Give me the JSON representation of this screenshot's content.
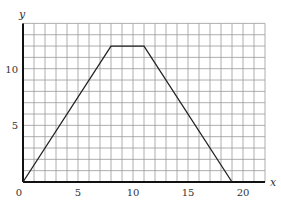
{
  "chart_data": {
    "type": "line",
    "title": "",
    "xlabel": "x",
    "ylabel": "y",
    "xlim": [
      0,
      22
    ],
    "ylim": [
      0,
      14
    ],
    "grid": true,
    "grid_step": 1,
    "xticks": [
      0,
      5,
      10,
      15,
      20
    ],
    "yticks": [
      5,
      10
    ],
    "origin_label": "0",
    "series": [
      {
        "name": "trapezoid",
        "points": [
          [
            0,
            0
          ],
          [
            8,
            12
          ],
          [
            11,
            12
          ],
          [
            19,
            0
          ]
        ]
      }
    ]
  },
  "colors": {
    "grid": "#999999",
    "axis": "#111111",
    "line": "#222222",
    "text": "#333333"
  }
}
